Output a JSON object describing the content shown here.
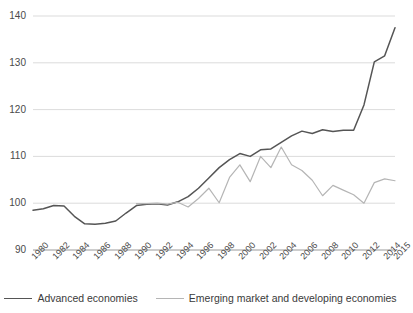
{
  "chart_data": {
    "type": "line",
    "title": "",
    "xlabel": "",
    "ylabel": "",
    "ylim": [
      90,
      140
    ],
    "yticks": [
      90,
      100,
      110,
      120,
      130,
      140
    ],
    "grid": "horizontal",
    "legend_position": "bottom",
    "x": [
      1980,
      1981,
      1982,
      1983,
      1984,
      1985,
      1986,
      1987,
      1988,
      1989,
      1990,
      1991,
      1992,
      1993,
      1994,
      1995,
      1996,
      1997,
      1998,
      1999,
      2000,
      2001,
      2002,
      2003,
      2004,
      2005,
      2006,
      2007,
      2008,
      2009,
      2010,
      2011,
      2012,
      2013,
      2014,
      2015
    ],
    "xtick_labels": [
      "1980",
      "1982",
      "1984",
      "1986",
      "1988",
      "1990",
      "1992",
      "1994",
      "1996",
      "1998",
      "2000",
      "2002",
      "2004",
      "2006",
      "2008",
      "2010",
      "2012",
      "2014",
      "2015"
    ],
    "xtick_years": [
      1980,
      1982,
      1984,
      1986,
      1988,
      1990,
      1992,
      1994,
      1996,
      1998,
      2000,
      2002,
      2004,
      2006,
      2008,
      2010,
      2012,
      2014,
      2015
    ],
    "series": [
      {
        "name": "Advanced economies",
        "color": "#555555",
        "values": [
          98.5,
          98.8,
          99.5,
          99.4,
          97.2,
          95.6,
          95.5,
          95.7,
          96.2,
          97.9,
          99.5,
          99.8,
          99.9,
          99.6,
          100.3,
          101.4,
          103.2,
          105.4,
          107.6,
          109.3,
          110.6,
          110.0,
          111.4,
          111.6,
          113.0,
          114.4,
          115.4,
          114.9,
          115.7,
          115.3,
          115.6,
          115.6,
          121.0,
          130.2,
          131.5,
          137.5
        ]
      },
      {
        "name": "Emerging market and developing economies",
        "color": "#b5b5b5",
        "values": [
          null,
          null,
          null,
          null,
          null,
          null,
          null,
          null,
          null,
          null,
          99.9,
          99.9,
          100.0,
          99.8,
          100.2,
          99.2,
          101.0,
          103.2,
          100.1,
          105.5,
          108.2,
          104.6,
          110.0,
          107.6,
          112.0,
          108.2,
          107.0,
          104.9,
          101.6,
          103.8,
          102.8,
          101.8,
          100.0,
          104.4,
          105.2,
          104.8
        ]
      }
    ]
  },
  "legend": {
    "items": [
      {
        "label": "Advanced economies",
        "color": "#555555"
      },
      {
        "label": "Emerging market and developing economies",
        "color": "#b5b5b5"
      }
    ]
  }
}
